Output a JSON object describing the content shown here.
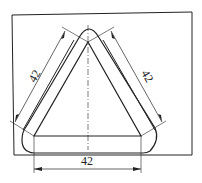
{
  "drawing": {
    "type": "technical-drawing",
    "subject": "triangular plate with rounded outer profile",
    "dimensions": {
      "left_side": "42",
      "right_side": "42",
      "bottom": "42"
    },
    "colors": {
      "line": "#222222",
      "background": "#ffffff"
    }
  }
}
